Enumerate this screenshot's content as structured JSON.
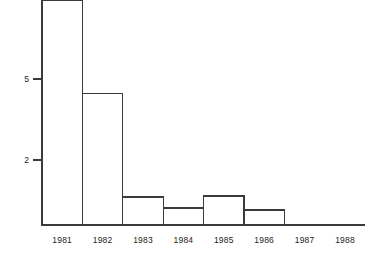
{
  "chart_data": {
    "type": "bar",
    "title": "",
    "subtitle": "",
    "xlabel": "",
    "ylabel": "",
    "categories": [
      "1981",
      "1982",
      "1983",
      "1984",
      "1985",
      "1986",
      "1987",
      "1988"
    ],
    "values": [
      7.9,
      4.45,
      0.63,
      0.22,
      0.67,
      0.15,
      0,
      0
    ],
    "series": [
      {
        "name": "count",
        "values": [
          7.9,
          4.45,
          0.63,
          0.22,
          0.67,
          0.15,
          0,
          0
        ]
      }
    ],
    "ylim": [
      0,
      8.2
    ],
    "xlim": [
      0,
      8
    ],
    "y_ticks": [
      2,
      5
    ],
    "y_tick_labels": [
      "2",
      "5"
    ],
    "x_tick_labels": [
      "1981",
      "1982",
      "1983",
      "1984",
      "1985",
      "1986",
      "1987",
      "1988"
    ],
    "grid": false,
    "legend": null,
    "legend_position": "none",
    "bar_style": {
      "fill": "#ffffff",
      "stroke": "#3a3a3a",
      "edge_width": 1.2,
      "gap": 0,
      "note": "adjacent histogram-style bars with no gaps"
    },
    "axis_style": {
      "color": "#3a3a3a",
      "y_axis_visible": true,
      "x_axis_visible": true,
      "tick_direction": "out",
      "top_spine": false,
      "right_spine": false
    },
    "annotations": []
  },
  "geometry": {
    "width": 386,
    "height": 262,
    "plot_left": 42,
    "plot_right": 365,
    "baseline_y": 225,
    "axis_top_y": 12,
    "slot_width": 40.4,
    "tick_5_y": 79,
    "tick_2_y": 160,
    "tick_len": 9,
    "x_label_y": 243
  },
  "colors": {
    "background": "#ffffff",
    "ink": "#3a3a3a",
    "text": "#232323"
  }
}
